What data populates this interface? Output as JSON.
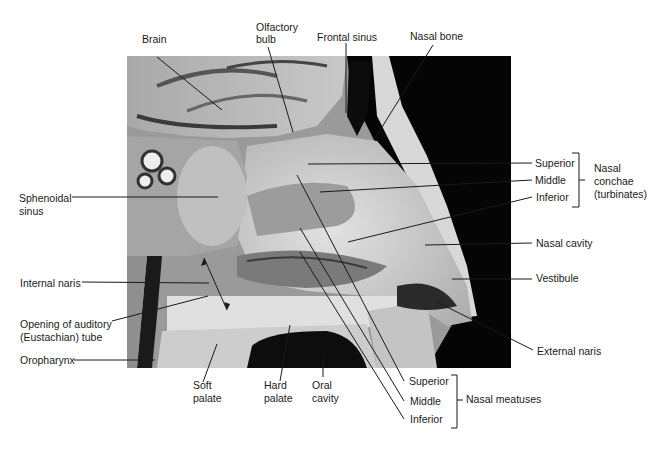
{
  "figure": {
    "photo_region": {
      "x": 127,
      "y": 56,
      "width": 384,
      "height": 312
    }
  },
  "labels": {
    "brain": "Brain",
    "olfactory_bulb_1": "Olfactory",
    "olfactory_bulb_2": "bulb",
    "frontal_sinus": "Frontal sinus",
    "nasal_bone": "Nasal bone",
    "sphenoidal_sinus_1": "Sphenoidal",
    "sphenoidal_sinus_2": "sinus",
    "internal_naris": "Internal naris",
    "auditory_tube_1": "Opening of auditory",
    "auditory_tube_2": "(Eustachian) tube",
    "oropharynx": "Oropharynx",
    "soft_palate_1": "Soft",
    "soft_palate_2": "palate",
    "hard_palate_1": "Hard",
    "hard_palate_2": "palate",
    "oral_cavity_1": "Oral",
    "oral_cavity_2": "cavity",
    "conchae_superior": "Superior",
    "conchae_middle": "Middle",
    "conchae_inferior": "Inferior",
    "conchae_group_1": "Nasal",
    "conchae_group_2": "conchae",
    "conchae_group_3": "(turbinates)",
    "nasal_cavity": "Nasal cavity",
    "vestibule": "Vestibule",
    "external_naris": "External naris",
    "meatus_superior": "Superior",
    "meatus_middle": "Middle",
    "meatus_inferior": "Inferior",
    "meatus_group": "Nasal meatuses"
  },
  "colors": {
    "leader_line": "#1a1a1a",
    "text": "#1a1a1a",
    "background": "#ffffff",
    "photo_dark": "#050505",
    "photo_tissue": "#c9c9c9"
  }
}
